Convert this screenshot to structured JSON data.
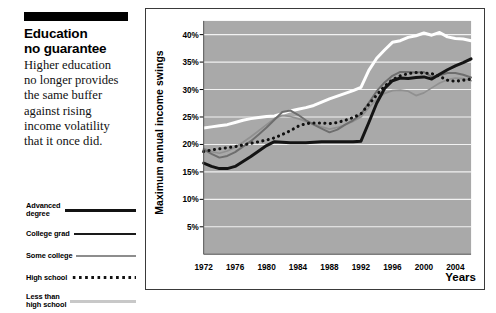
{
  "article": {
    "headline_lines": [
      "Education",
      "no guarantee"
    ],
    "body_lines": [
      "Higher education",
      "no longer provides",
      "the same buffer",
      "against rising",
      "income volatility",
      "that it once did."
    ]
  },
  "legend": {
    "items": [
      {
        "label": "Advanced\ndegree",
        "style": "thick",
        "color": "#131313"
      },
      {
        "label": "College grad",
        "style": "med",
        "color": "#1a1a1a"
      },
      {
        "label": "Some college",
        "style": "thin",
        "color": "#8d8d8d"
      },
      {
        "label": "High school",
        "style": "dotted",
        "color": "#111111"
      },
      {
        "label": "Less than\nhigh school",
        "style": "light",
        "color": "#c8c8c8"
      }
    ]
  },
  "chart_data": {
    "type": "line",
    "title": "",
    "xlabel": "Years",
    "ylabel": "Maximum annual income swings",
    "xlim": [
      1972,
      2006
    ],
    "ylim": [
      0,
      42.5
    ],
    "grid": true,
    "plot_background": "#a9a9a9",
    "gridline_color": "#f2f2f2",
    "legend_position": "external-left",
    "ytick_labels": [
      "5%",
      "10%",
      "15%",
      "20%",
      "25%",
      "30%",
      "35%",
      "40%"
    ],
    "ytick_values": [
      5,
      10,
      15,
      20,
      25,
      30,
      35,
      40
    ],
    "xtick_labels": [
      "1972",
      "1976",
      "1980",
      "1984",
      "1988",
      "1992",
      "1996",
      "2000",
      "2004"
    ],
    "xtick_values": [
      1972,
      1976,
      1980,
      1984,
      1988,
      1992,
      1996,
      2000,
      2004
    ],
    "x": [
      1972,
      1973,
      1974,
      1975,
      1976,
      1977,
      1978,
      1979,
      1980,
      1981,
      1982,
      1983,
      1984,
      1985,
      1986,
      1987,
      1988,
      1989,
      1990,
      1991,
      1992,
      1993,
      1994,
      1995,
      1996,
      1997,
      1998,
      1999,
      2000,
      2001,
      2002,
      2003,
      2004,
      2005,
      2006
    ],
    "series": [
      {
        "name": "Less than high school",
        "style": "solid-thick-white",
        "color": "#ffffff",
        "values": [
          23.0,
          23.2,
          23.4,
          23.6,
          24.0,
          24.4,
          24.7,
          24.9,
          25.1,
          25.2,
          25.6,
          26.1,
          26.4,
          26.7,
          27.1,
          27.7,
          28.3,
          28.8,
          29.3,
          29.8,
          30.4,
          33.5,
          35.7,
          37.2,
          38.6,
          38.9,
          39.5,
          39.8,
          40.3,
          39.9,
          40.4,
          39.6,
          39.3,
          39.2,
          38.9
        ]
      },
      {
        "name": "High school",
        "style": "dotted",
        "color": "#111111",
        "values": [
          18.7,
          19.0,
          19.2,
          19.4,
          19.6,
          19.9,
          20.2,
          20.5,
          20.8,
          21.2,
          21.8,
          22.5,
          23.3,
          23.8,
          23.9,
          23.9,
          23.8,
          24.0,
          24.4,
          24.9,
          25.6,
          27.3,
          29.0,
          30.6,
          31.8,
          32.5,
          32.9,
          33.1,
          33.0,
          32.9,
          32.4,
          31.7,
          31.5,
          31.7,
          31.9
        ]
      },
      {
        "name": "College grad",
        "style": "solid-medium-gray",
        "color": "#6e6e6e",
        "values": [
          19.1,
          18.3,
          17.6,
          17.9,
          18.6,
          19.6,
          20.6,
          21.8,
          23.1,
          24.5,
          25.9,
          26.2,
          25.4,
          24.4,
          23.6,
          22.9,
          22.2,
          22.7,
          23.6,
          24.4,
          25.5,
          27.6,
          29.7,
          31.3,
          32.5,
          33.2,
          33.2,
          33.1,
          33.2,
          32.3,
          32.6,
          33.0,
          33.0,
          32.7,
          32.2
        ]
      },
      {
        "name": "Some college",
        "style": "solid-thin-gray",
        "color": "#909090",
        "values": [
          19.3,
          18.7,
          18.4,
          18.8,
          19.5,
          20.4,
          21.4,
          22.5,
          23.6,
          24.7,
          25.3,
          25.1,
          24.7,
          24.2,
          23.7,
          23.2,
          22.8,
          23.1,
          23.6,
          24.2,
          25.0,
          26.7,
          28.2,
          29.3,
          29.8,
          29.9,
          29.7,
          28.9,
          29.4,
          30.3,
          31.2,
          31.8,
          32.1,
          32.0,
          31.6
        ]
      },
      {
        "name": "Advanced degree",
        "style": "solid-thick-black",
        "color": "#141414",
        "values": [
          16.6,
          16.0,
          15.6,
          15.6,
          16.0,
          16.9,
          17.8,
          18.8,
          19.8,
          20.5,
          20.4,
          20.3,
          20.3,
          20.3,
          20.4,
          20.5,
          20.5,
          20.5,
          20.5,
          20.5,
          20.6,
          24.0,
          27.5,
          30.2,
          31.6,
          32.1,
          32.0,
          32.2,
          32.3,
          31.9,
          32.8,
          33.6,
          34.3,
          34.9,
          35.6
        ]
      }
    ]
  }
}
